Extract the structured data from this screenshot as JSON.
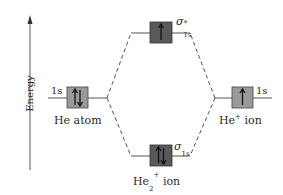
{
  "diagram": {
    "axis": {
      "label": "Energy",
      "direction": "up"
    },
    "colors": {
      "atomic_box": "#9a9a9a",
      "mo_box": "#595959",
      "line": "#555555",
      "electron": "#111111"
    },
    "left": {
      "species": "He atom",
      "orbital": "1s",
      "electrons": "↑↓"
    },
    "right": {
      "species_base": "He",
      "species_charge": "+",
      "species_suffix": "ion",
      "orbital": "1s",
      "electrons": "↑"
    },
    "antibonding": {
      "symbol": "σ",
      "star": "*",
      "sub": "1s",
      "electrons": "↑"
    },
    "bonding": {
      "symbol": "σ",
      "sub": "1s",
      "electrons": "↑↓"
    },
    "molecule": {
      "base": "He",
      "subscript": "2",
      "charge": "+",
      "suffix": "ion"
    }
  }
}
